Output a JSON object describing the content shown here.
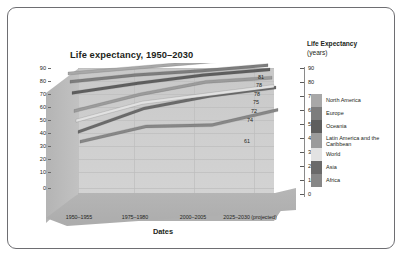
{
  "chart_data": {
    "type": "area",
    "title": "Life expectancy, 1950–2030",
    "xlabel": "Dates",
    "ylabel": "Life Expectancy",
    "ylabel_unit": "(years)",
    "categories": [
      "1950–1955",
      "1975–1980",
      "2000–2005",
      "2025–2030 (projected)"
    ],
    "ylim": [
      0,
      90
    ],
    "yticks": [
      0,
      10,
      20,
      30,
      40,
      50,
      60,
      70,
      80,
      90
    ],
    "grid": true,
    "legend_position": "right",
    "series": [
      {
        "name": "North America",
        "color": "#a8a8a8",
        "values": [
          69,
          73,
          77,
          81
        ],
        "end_label": "81"
      },
      {
        "name": "Europe",
        "color": "#7d7d7d",
        "values": [
          66,
          71,
          74,
          78
        ],
        "end_label": "78"
      },
      {
        "name": "Oceania",
        "color": "#5e5e5e",
        "values": [
          61,
          68,
          74,
          78
        ],
        "end_label": "78"
      },
      {
        "name": "Latin America and the Caribbean",
        "color": "#9b9b9b",
        "values": [
          51,
          63,
          72,
          75
        ],
        "end_label": "75"
      },
      {
        "name": "World",
        "color": "#e2e2e2",
        "values": [
          47,
          60,
          66,
          72
        ],
        "end_label": "72"
      },
      {
        "name": "Asia",
        "color": "#6a6a6a",
        "values": [
          42,
          59,
          68,
          74
        ],
        "end_label": "74"
      },
      {
        "name": "Africa",
        "color": "#878787",
        "values": [
          38,
          49,
          50,
          61
        ],
        "end_label": "61"
      }
    ],
    "end_labels": [
      "81",
      "78",
      "78",
      "75",
      "72",
      "74",
      "61"
    ]
  },
  "axis_left": {
    "ticks": [
      "90",
      "80",
      "70",
      "60",
      "50",
      "40",
      "30",
      "20",
      "10",
      "0"
    ]
  },
  "axis_right": {
    "ticks": [
      "90",
      "80",
      "70",
      "60",
      "50",
      "40",
      "30",
      "20",
      "10",
      "0"
    ]
  },
  "legend": {
    "items": [
      {
        "label": "North America"
      },
      {
        "label": "Europe"
      },
      {
        "label": "Oceania"
      },
      {
        "label": "Latin America and the Caribbean"
      },
      {
        "label": "World"
      },
      {
        "label": "Asia"
      },
      {
        "label": "Africa"
      }
    ]
  }
}
